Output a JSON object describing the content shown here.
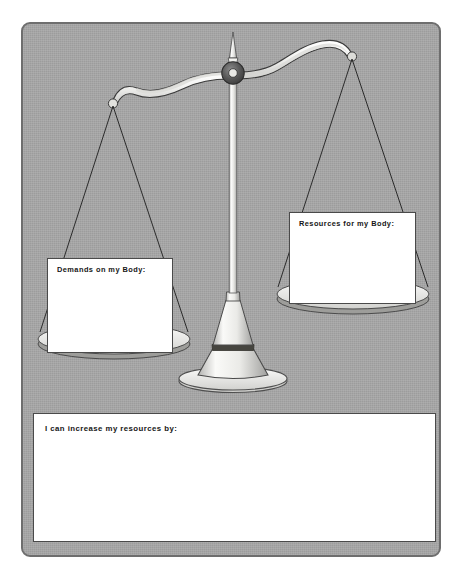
{
  "worksheet": {
    "title": "Demands and Resources Balance Scale Worksheet",
    "panel_color": "#a8a8a8",
    "panel_border_color": "#6e6e6e",
    "box_fill_color": "#ffffff",
    "box_border_color": "#4a4a4a",
    "text_color": "#161616"
  },
  "scale": {
    "name": "balance-scale",
    "beam_color": "#f2f2f0",
    "beam_outline_color": "#3a3a3a",
    "hub_color": "#4a4a4a",
    "string_color": "#2b2b2b",
    "left_arm_lower": true,
    "right_arm_higher": true,
    "left_pivot": {
      "x": 113,
      "y": 104
    },
    "right_pivot": {
      "x": 353,
      "y": 57
    },
    "center_hub": {
      "x": 233,
      "y": 72
    },
    "base_center": {
      "x": 233,
      "y": 381
    }
  },
  "boxes": {
    "demands": {
      "label": "Demands on my Body:",
      "value": "",
      "placeholder": ""
    },
    "resources": {
      "label": "Resources for my Body:",
      "value": "",
      "placeholder": ""
    },
    "increase": {
      "label": "I can increase my resources by:",
      "value": "",
      "placeholder": ""
    }
  }
}
